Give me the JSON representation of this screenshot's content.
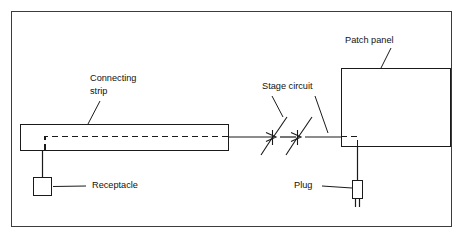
{
  "figure": {
    "background_color": "#ffffff",
    "line_color": "#1a1a1a",
    "frame_color": "#3c3c3c",
    "width": 463,
    "height": 239
  },
  "labels": {
    "connecting_strip_line1": "Connecting",
    "connecting_strip_line2": "strip",
    "receptacle": "Receptacle",
    "stage_circuit": "Stage circuit",
    "patch_panel": "Patch panel",
    "plug": "Plug"
  },
  "components": [
    {
      "name": "connecting-strip",
      "label": "Connecting strip",
      "shape": "rectangle"
    },
    {
      "name": "receptacle",
      "label": "Receptacle",
      "shape": "square"
    },
    {
      "name": "stage-circuit",
      "label": "Stage circuit",
      "shape": "knife-switch-pair",
      "count": 2
    },
    {
      "name": "patch-panel",
      "label": "Patch panel",
      "shape": "rectangle"
    },
    {
      "name": "plug",
      "label": "Plug",
      "shape": "plug-body-with-prongs"
    }
  ],
  "connections": [
    {
      "from": "receptacle",
      "to": "connecting-strip",
      "style": "solid"
    },
    {
      "from": "connecting-strip",
      "to": "stage-circuit",
      "style": "solid"
    },
    {
      "from": "stage-circuit",
      "to": "patch-panel",
      "style": "solid"
    },
    {
      "from": "patch-panel",
      "to": "plug",
      "style": "solid"
    },
    {
      "from": "connecting-strip-internal",
      "to": "patch-panel-internal",
      "style": "dashed"
    }
  ]
}
